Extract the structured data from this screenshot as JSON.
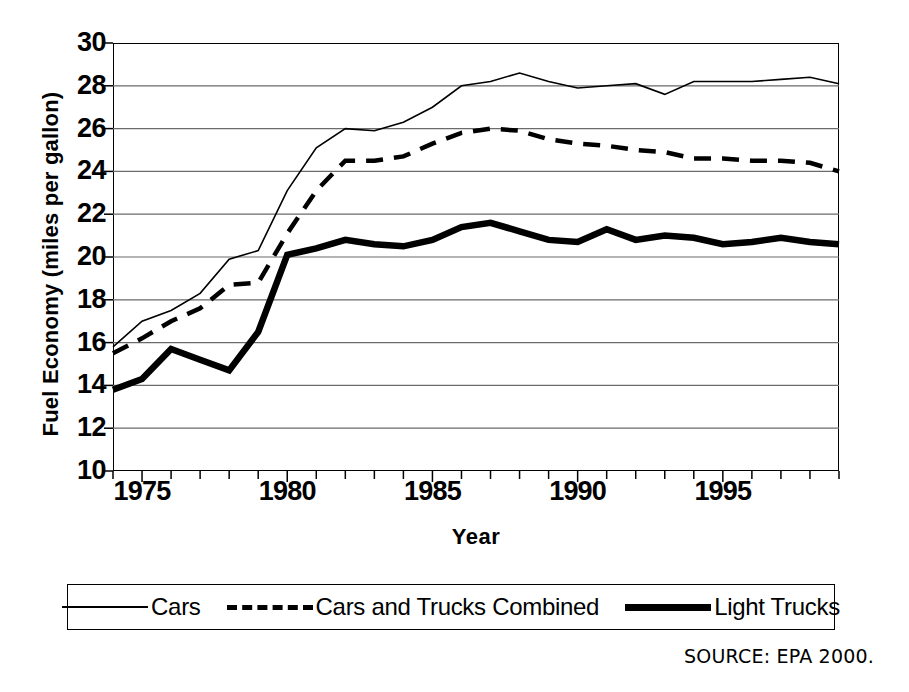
{
  "chart_data": {
    "type": "line",
    "title": "",
    "xlabel": "Year",
    "ylabel": "Fuel Economy (miles per gallon)",
    "xlim": [
      1974,
      1999
    ],
    "ylim": [
      10,
      30
    ],
    "ytick_step": 2,
    "xtick_step": 1,
    "grid": true,
    "legend_position": "bottom",
    "yticks": [
      "30",
      "28",
      "26",
      "24",
      "22",
      "20",
      "18",
      "16",
      "14",
      "12",
      "10"
    ],
    "ytick_values": [
      30,
      28,
      26,
      24,
      22,
      20,
      18,
      16,
      14,
      12,
      10
    ],
    "xticks": [
      "1975",
      "1980",
      "1985",
      "1990",
      "1995"
    ],
    "xtick_values": [
      1975,
      1980,
      1985,
      1990,
      1995
    ],
    "x": [
      1974,
      1975,
      1976,
      1977,
      1978,
      1979,
      1980,
      1981,
      1982,
      1983,
      1984,
      1985,
      1986,
      1987,
      1988,
      1989,
      1990,
      1991,
      1992,
      1993,
      1994,
      1995,
      1996,
      1997,
      1998,
      1999
    ],
    "series": [
      {
        "name": "Cars",
        "style": "solid-thin",
        "values": [
          15.8,
          17.0,
          17.5,
          18.3,
          19.9,
          20.3,
          23.1,
          25.1,
          26.0,
          25.9,
          26.3,
          27.0,
          28.0,
          28.2,
          28.6,
          28.2,
          27.9,
          28.0,
          28.1,
          27.6,
          28.2,
          28.2,
          28.2,
          28.3,
          28.4,
          28.1
        ],
        "line_width": 1.6,
        "color": "#000000"
      },
      {
        "name": "Cars and Trucks Combined",
        "style": "dashed",
        "values": [
          15.5,
          16.2,
          17.0,
          17.6,
          18.7,
          18.8,
          21.1,
          23.1,
          24.5,
          24.5,
          24.7,
          25.3,
          25.8,
          26.0,
          25.9,
          25.5,
          25.3,
          25.2,
          25.0,
          24.9,
          24.6,
          24.6,
          24.5,
          24.5,
          24.4,
          24.0
        ],
        "line_width": 4.5,
        "color": "#000000"
      },
      {
        "name": "Light Trucks",
        "style": "solid-thick",
        "values": [
          13.8,
          14.3,
          15.7,
          15.2,
          14.7,
          16.5,
          20.1,
          20.4,
          20.8,
          20.6,
          20.5,
          20.8,
          21.4,
          21.6,
          21.2,
          20.8,
          20.7,
          21.3,
          20.8,
          21.0,
          20.9,
          20.6,
          20.7,
          20.9,
          20.7,
          20.6
        ],
        "line_width": 6.5,
        "color": "#000000"
      }
    ]
  },
  "legend": {
    "entries": [
      {
        "label": "Cars",
        "key": "solid-thin-key"
      },
      {
        "label": "Cars and Trucks Combined",
        "key": "dashed-key"
      },
      {
        "label": "Light Trucks",
        "key": "solid-thick-key"
      }
    ]
  },
  "source": {
    "text": "SOURCE: EPA 2000."
  },
  "colors": {
    "ink": "#000000",
    "grid": "#6b6b6b",
    "background": "#ffffff"
  }
}
